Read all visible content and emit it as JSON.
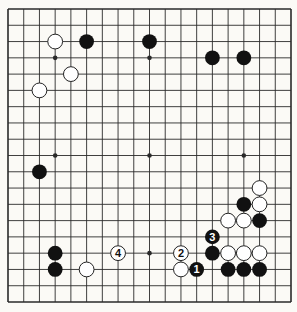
{
  "diagram": {
    "type": "go-board",
    "size": 19,
    "colors": {
      "background": "#fbfaf6",
      "grid": "#2a2a2a",
      "black_stone": "#111111",
      "white_stone": "#ffffff",
      "stone_outline": "#222222"
    },
    "star_points": [
      [
        3,
        3
      ],
      [
        9,
        3
      ],
      [
        15,
        3
      ],
      [
        3,
        9
      ],
      [
        9,
        9
      ],
      [
        15,
        9
      ],
      [
        3,
        15
      ],
      [
        9,
        15
      ],
      [
        15,
        15
      ]
    ],
    "stones": [
      {
        "col": 3,
        "row": 2,
        "color": "white",
        "label": ""
      },
      {
        "col": 5,
        "row": 2,
        "color": "black",
        "label": ""
      },
      {
        "col": 9,
        "row": 2,
        "color": "black",
        "label": ""
      },
      {
        "col": 13,
        "row": 3,
        "color": "black",
        "label": ""
      },
      {
        "col": 15,
        "row": 3,
        "color": "black",
        "label": ""
      },
      {
        "col": 4,
        "row": 4,
        "color": "white",
        "label": ""
      },
      {
        "col": 2,
        "row": 5,
        "color": "white",
        "label": ""
      },
      {
        "col": 2,
        "row": 10,
        "color": "black",
        "label": ""
      },
      {
        "col": 16,
        "row": 11,
        "color": "white",
        "label": ""
      },
      {
        "col": 15,
        "row": 12,
        "color": "black",
        "label": ""
      },
      {
        "col": 16,
        "row": 12,
        "color": "white",
        "label": ""
      },
      {
        "col": 14,
        "row": 13,
        "color": "white",
        "label": ""
      },
      {
        "col": 15,
        "row": 13,
        "color": "white",
        "label": ""
      },
      {
        "col": 16,
        "row": 13,
        "color": "black",
        "label": ""
      },
      {
        "col": 13,
        "row": 14,
        "color": "black",
        "label": "3"
      },
      {
        "col": 13,
        "row": 15,
        "color": "black",
        "label": ""
      },
      {
        "col": 14,
        "row": 15,
        "color": "white",
        "label": ""
      },
      {
        "col": 15,
        "row": 15,
        "color": "white",
        "label": ""
      },
      {
        "col": 16,
        "row": 15,
        "color": "white",
        "label": ""
      },
      {
        "col": 14,
        "row": 16,
        "color": "black",
        "label": ""
      },
      {
        "col": 15,
        "row": 16,
        "color": "black",
        "label": ""
      },
      {
        "col": 16,
        "row": 16,
        "color": "black",
        "label": ""
      },
      {
        "col": 3,
        "row": 15,
        "color": "black",
        "label": ""
      },
      {
        "col": 3,
        "row": 16,
        "color": "black",
        "label": ""
      },
      {
        "col": 5,
        "row": 16,
        "color": "white",
        "label": ""
      },
      {
        "col": 7,
        "row": 15,
        "color": "white",
        "label": "4"
      },
      {
        "col": 11,
        "row": 15,
        "color": "white",
        "label": "2"
      },
      {
        "col": 11,
        "row": 16,
        "color": "white",
        "label": ""
      },
      {
        "col": 12,
        "row": 16,
        "color": "black",
        "label": "1"
      }
    ]
  }
}
